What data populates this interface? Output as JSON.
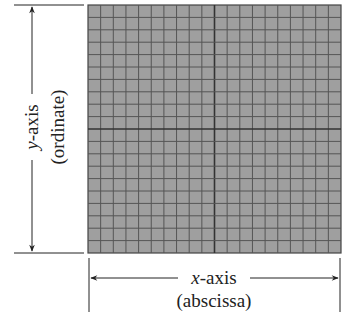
{
  "diagram": {
    "y_axis": {
      "name": "y",
      "suffix": "-axis",
      "alias": "(ordinate)"
    },
    "x_axis": {
      "name": "x",
      "suffix": "-axis",
      "alias": "(abscissa)"
    },
    "grid": {
      "columns": 20,
      "rows": 20,
      "fill_color": "#9f9f9f",
      "line_color": "#555555",
      "center_line_color": "#333333"
    }
  }
}
